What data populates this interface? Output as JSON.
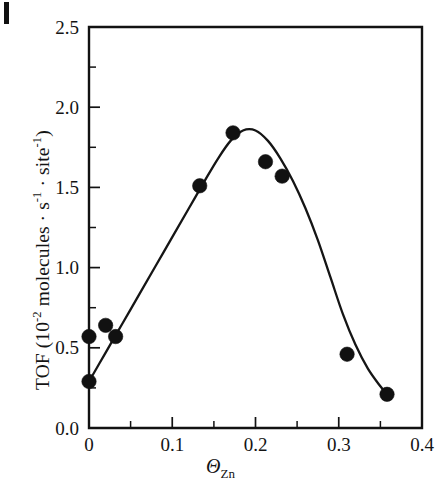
{
  "figure": {
    "scan_artifact": "scan-mark"
  },
  "chart_data": {
    "type": "scatter",
    "title": "",
    "subtitle": "",
    "xlabel": "ΘZn",
    "xlabel_symbol": "Θ",
    "xlabel_subscript": "Zn",
    "ylabel": "TOF (10⁻² molecules · s⁻¹ · site⁻¹)",
    "ylabel_prefix": "TOF (10",
    "ylabel_exp1": "-2",
    "ylabel_mid": " molecules · s",
    "ylabel_exp2": "-1",
    "ylabel_mid2": " · site",
    "ylabel_exp3": "-1",
    "ylabel_suffix": ")",
    "xlim": [
      0,
      0.4
    ],
    "ylim": [
      0,
      2.5
    ],
    "xticks": [
      0,
      0.1,
      0.2,
      0.3,
      0.4
    ],
    "xtick_labels": [
      "0",
      "0.1",
      "0.2",
      "0.3",
      "0.4"
    ],
    "yticks": [
      0.0,
      0.5,
      1.0,
      1.5,
      2.0,
      2.5
    ],
    "ytick_labels": [
      "0.0",
      "0.5",
      "1.0",
      "1.5",
      "2.0",
      "2.5"
    ],
    "x_minor_ticks": [
      0.05,
      0.15,
      0.25,
      0.35
    ],
    "y_minor_ticks": [
      0.25,
      0.75,
      1.25,
      1.75,
      2.25
    ],
    "grid": false,
    "legend": false,
    "marker": "filled-circle",
    "marker_color": "#111111",
    "line_color": "#151515",
    "points": [
      {
        "x": 0.0,
        "y": 0.57
      },
      {
        "x": 0.0,
        "y": 0.29
      },
      {
        "x": 0.02,
        "y": 0.64
      },
      {
        "x": 0.032,
        "y": 0.57
      },
      {
        "x": 0.133,
        "y": 1.51
      },
      {
        "x": 0.173,
        "y": 1.84
      },
      {
        "x": 0.212,
        "y": 1.66
      },
      {
        "x": 0.232,
        "y": 1.57
      },
      {
        "x": 0.31,
        "y": 0.46
      },
      {
        "x": 0.358,
        "y": 0.21
      }
    ],
    "fit_curve": [
      {
        "x": 0.0,
        "y": 0.29
      },
      {
        "x": 0.02,
        "y": 0.47
      },
      {
        "x": 0.04,
        "y": 0.65
      },
      {
        "x": 0.06,
        "y": 0.83
      },
      {
        "x": 0.08,
        "y": 1.01
      },
      {
        "x": 0.1,
        "y": 1.19
      },
      {
        "x": 0.12,
        "y": 1.37
      },
      {
        "x": 0.14,
        "y": 1.55
      },
      {
        "x": 0.155,
        "y": 1.68
      },
      {
        "x": 0.17,
        "y": 1.79
      },
      {
        "x": 0.185,
        "y": 1.855
      },
      {
        "x": 0.2,
        "y": 1.855
      },
      {
        "x": 0.215,
        "y": 1.79
      },
      {
        "x": 0.23,
        "y": 1.68
      },
      {
        "x": 0.245,
        "y": 1.54
      },
      {
        "x": 0.26,
        "y": 1.37
      },
      {
        "x": 0.275,
        "y": 1.17
      },
      {
        "x": 0.29,
        "y": 0.94
      },
      {
        "x": 0.305,
        "y": 0.71
      },
      {
        "x": 0.32,
        "y": 0.52
      },
      {
        "x": 0.335,
        "y": 0.37
      },
      {
        "x": 0.35,
        "y": 0.26
      },
      {
        "x": 0.358,
        "y": 0.21
      }
    ]
  }
}
